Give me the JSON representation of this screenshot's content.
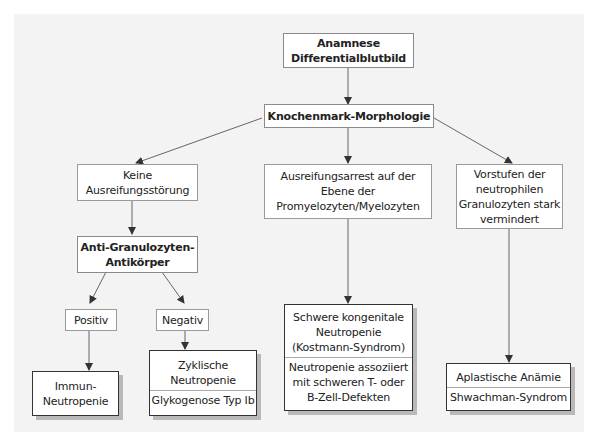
{
  "diagram": {
    "type": "flowchart",
    "language": "de",
    "nodes": {
      "root": {
        "lines": [
          "Anamnese",
          "Differentialblutbild"
        ]
      },
      "morphology": {
        "lines": [
          "Knochenmark-Morphologie"
        ]
      },
      "no_maturation_disorder": {
        "lines": [
          "Keine",
          "Ausreifungsstörung"
        ]
      },
      "maturation_arrest": {
        "lines": [
          "Ausreifungsarrest auf der",
          "Ebene der",
          "Promyelozyten/Myelozyten"
        ]
      },
      "precursors_reduced": {
        "lines": [
          "Vorstufen der",
          "neutrophilen",
          "Granulozyten stark",
          "vermindert"
        ]
      },
      "antibodies": {
        "lines": [
          "Anti-Granulozyten-",
          "Antikörper"
        ]
      },
      "positive": {
        "lines": [
          "Positiv"
        ]
      },
      "negative": {
        "lines": [
          "Negativ"
        ]
      },
      "immune_neutropenia": {
        "lines": [
          "Immun-",
          "Neutropenie"
        ]
      },
      "cyclic": {
        "sections": [
          {
            "lines": [
              "Zyklische",
              "Neutropenie"
            ]
          },
          {
            "lines": [
              "Glykogenose Typ Ib"
            ]
          }
        ]
      },
      "severe_congenital": {
        "sections": [
          {
            "lines": [
              "Schwere kongenitale",
              "Neutropenie",
              "(Kostmann-Syndrom)"
            ]
          },
          {
            "lines": [
              "Neutropenie assoziiert",
              "mit schweren T- oder",
              "B-Zell-Defekten"
            ]
          }
        ]
      },
      "aplastic": {
        "sections": [
          {
            "lines": [
              "Aplastische Anämie"
            ]
          },
          {
            "lines": [
              "Shwachman-Syndrom"
            ]
          }
        ]
      }
    },
    "edges": [
      [
        "root",
        "morphology"
      ],
      [
        "morphology",
        "no_maturation_disorder"
      ],
      [
        "morphology",
        "maturation_arrest"
      ],
      [
        "morphology",
        "precursors_reduced"
      ],
      [
        "no_maturation_disorder",
        "antibodies"
      ],
      [
        "antibodies",
        "positive"
      ],
      [
        "antibodies",
        "negative"
      ],
      [
        "positive",
        "immune_neutropenia"
      ],
      [
        "negative",
        "cyclic"
      ],
      [
        "maturation_arrest",
        "severe_congenital"
      ],
      [
        "precursors_reduced",
        "aplastic"
      ]
    ],
    "colors": {
      "panel_background": "#f3f3f3",
      "box_background": "#ffffff",
      "box_border": "#9a9a9a",
      "final_box_border": "#333333",
      "final_box_shadow": "#b9b9b9",
      "connector": "#555555"
    }
  }
}
